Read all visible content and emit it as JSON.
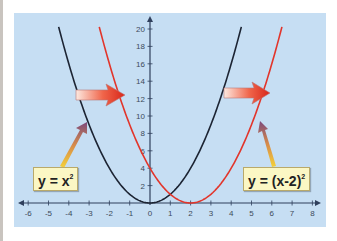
{
  "chart_data": {
    "type": "line",
    "title": "",
    "xlabel": "",
    "ylabel": "",
    "xlim": [
      -6.5,
      8.5
    ],
    "ylim": [
      0,
      21
    ],
    "x_ticks": [
      -6,
      -5,
      -4,
      -3,
      -2,
      -1,
      0,
      1,
      2,
      3,
      4,
      5,
      6,
      7,
      8
    ],
    "y_ticks": [
      2,
      4,
      6,
      8,
      10,
      12,
      14,
      16,
      18,
      20
    ],
    "grid": false,
    "legend": "none (inline labels)",
    "series": [
      {
        "name": "y = x²",
        "color": "#1c2433",
        "x": [
          -4.5,
          -4,
          -3,
          -2,
          -1,
          0,
          1,
          2,
          3,
          4,
          4.5
        ],
        "values": [
          20.25,
          16,
          9,
          4,
          1,
          0,
          1,
          4,
          9,
          16,
          20.25
        ]
      },
      {
        "name": "y = (x-2)²",
        "color": "#e2352b",
        "x": [
          -2.5,
          -2,
          -1,
          0,
          1,
          2,
          3,
          4,
          5,
          6,
          6.5
        ],
        "values": [
          20.25,
          16,
          9,
          4,
          1,
          0,
          1,
          4,
          9,
          16,
          20.25
        ]
      }
    ],
    "annotations": [
      {
        "type": "arrow",
        "from": "y = x² at y≈13",
        "to": "y = (x-2)² at y≈13",
        "direction": "right",
        "meaning": "shift right by 2"
      },
      {
        "type": "arrow",
        "from": "y = x² at y≈13 (right branch)",
        "to": "y = (x-2)² at y≈13",
        "direction": "right"
      },
      {
        "type": "label-pointer",
        "label": "y = x²",
        "points_to": "left branch of y = x²"
      },
      {
        "type": "label-pointer",
        "label": "y = (x-2)²",
        "points_to": "right branch of y = (x-2)²"
      }
    ]
  },
  "labels": {
    "left_eq_main": "y = x",
    "left_eq_exp": "2",
    "right_eq_main": "y = (x-2)",
    "right_eq_exp": "2"
  },
  "colors": {
    "panel_bg": "#c6def3",
    "axis": "#2f3f5c",
    "curve_base": "#1c2433",
    "curve_shifted": "#e2352b",
    "label_bg": "#fbf7c4"
  }
}
